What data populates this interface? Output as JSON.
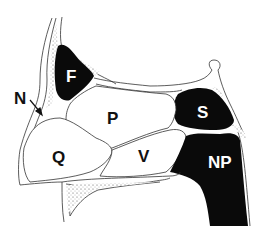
{
  "diagram": {
    "type": "anatomical sagittal section",
    "labels": {
      "N": "N",
      "F": "F",
      "P": "P",
      "Q": "Q",
      "S": "S",
      "V": "V",
      "NP": "NP"
    },
    "colors": {
      "background": "#ffffff",
      "outline": "#333333",
      "filled_cavity": "#0a0a0a",
      "label_dark": "#111111",
      "label_light": "#ffffff",
      "stipple": "#555555"
    }
  }
}
